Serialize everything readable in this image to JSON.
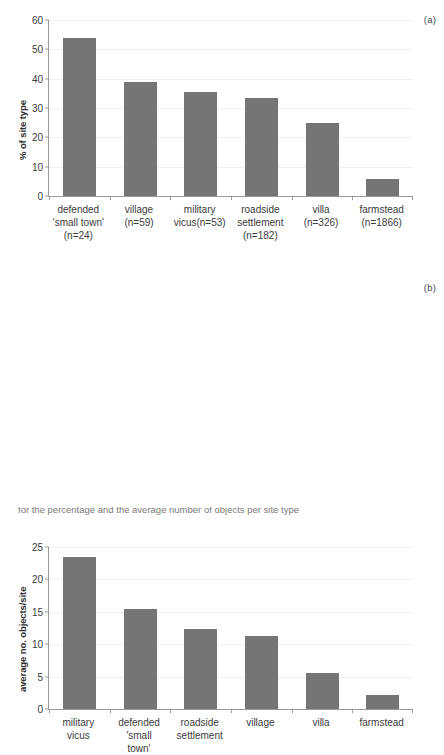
{
  "figure": {
    "panel_a_tag": "(a)",
    "panel_b_tag": "(b)",
    "bottom_caption": "for the percentage and the average number of objects per site type"
  },
  "chart_data": [
    {
      "type": "bar",
      "panel": "(a)",
      "title": "",
      "xlabel": "",
      "ylabel": "% of site type",
      "ylim": [
        0,
        60
      ],
      "yticks": [
        0,
        10,
        20,
        30,
        40,
        50,
        60
      ],
      "grid": true,
      "legend": "none",
      "bar_color": "#757575",
      "categories": [
        "defended\n'small town'\n(n=24)",
        "village\n(n=59)",
        "military\nvicus(n=53)",
        "roadside\nsettlement\n(n=182)",
        "villa\n(n=326)",
        "farmstead\n(n=1866)"
      ],
      "category_names": [
        "defended 'small town'",
        "village",
        "military vicus",
        "roadside settlement",
        "villa",
        "farmstead"
      ],
      "sample_sizes": [
        24,
        59,
        53,
        182,
        326,
        1866
      ],
      "values": [
        54.0,
        38.9,
        35.6,
        33.3,
        24.8,
        5.7
      ]
    },
    {
      "type": "bar",
      "panel": "(b)",
      "title": "",
      "xlabel": "",
      "ylabel": "average no. objects/site",
      "ylim": [
        0,
        25
      ],
      "yticks": [
        0,
        5,
        10,
        15,
        20,
        25
      ],
      "grid": true,
      "legend": "none",
      "bar_color": "#757575",
      "categories": [
        "military\nvicus",
        "defended\n'small\ntown'",
        "roadside\nsettlement",
        "village",
        "villa",
        "farmstead"
      ],
      "category_names": [
        "military vicus",
        "defended 'small town'",
        "roadside settlement",
        "village",
        "villa",
        "farmstead"
      ],
      "values": [
        23.5,
        15.4,
        12.3,
        11.2,
        5.6,
        2.2
      ]
    }
  ]
}
